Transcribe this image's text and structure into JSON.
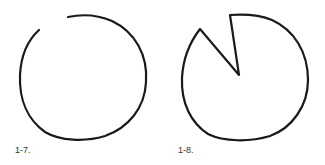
{
  "figures": [
    {
      "id": "fig-1-7",
      "label": "1-7.",
      "description": "hand-drawn circle with a gap at upper left"
    },
    {
      "id": "fig-1-8",
      "label": "1-8.",
      "description": "hand-drawn circle with a wedge notch cut toward the center"
    }
  ],
  "colors": {
    "stroke": "#1a1a1a",
    "label": "#333333",
    "background": "#ffffff"
  }
}
